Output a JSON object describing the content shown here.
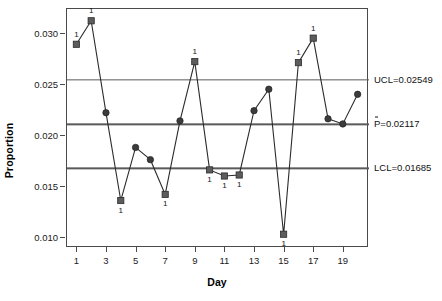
{
  "chart_data": {
    "type": "line",
    "title": "",
    "xlabel": "Day",
    "ylabel": "Proportion",
    "grid": false,
    "legend": "none",
    "xlim": [
      0.3,
      20.7
    ],
    "ylim": [
      0.00905,
      0.03245
    ],
    "x": [
      1,
      2,
      3,
      4,
      5,
      6,
      7,
      8,
      9,
      10,
      11,
      12,
      13,
      14,
      15,
      16,
      17,
      18,
      19,
      20
    ],
    "xticks": [
      1,
      3,
      5,
      7,
      9,
      11,
      13,
      15,
      17,
      19
    ],
    "xticklabels": [
      "1",
      "3",
      "5",
      "7",
      "9",
      "11",
      "13",
      "15",
      "17",
      "19"
    ],
    "yticks": [
      0.01,
      0.015,
      0.02,
      0.025,
      0.03
    ],
    "yticklabels": [
      "0.010",
      "0.015",
      "0.020",
      "0.025",
      "0.030"
    ],
    "series": [
      {
        "name": "Proportion",
        "values": [
          0.0289,
          0.0312,
          0.0222,
          0.0136,
          0.0188,
          0.0176,
          0.0142,
          0.0214,
          0.0272,
          0.0166,
          0.016,
          0.0161,
          0.0224,
          0.0245,
          0.0103,
          0.0271,
          0.0295,
          0.0216,
          0.0211,
          0.024
        ],
        "point_marker": [
          "square",
          "square",
          "circle",
          "square",
          "circle",
          "circle",
          "square",
          "circle",
          "square",
          "square",
          "square",
          "square",
          "circle",
          "circle",
          "square",
          "square",
          "square",
          "circle",
          "circle",
          "circle"
        ],
        "violation_flags": [
          "1",
          "1",
          "",
          "1",
          "",
          "",
          "1",
          "",
          "1",
          "1",
          "1",
          "1",
          "",
          "",
          "1",
          "1",
          "1",
          "",
          "",
          ""
        ],
        "violation_label_side": [
          "above",
          "above",
          "",
          "below",
          "",
          "",
          "below",
          "",
          "above",
          "below",
          "below",
          "below",
          "",
          "",
          "below",
          "above",
          "above",
          "",
          "",
          ""
        ],
        "line_color": "#2b2b2b",
        "marker_color": "#3c3c3c",
        "violation_marker_color": "#5c5c5c"
      }
    ],
    "control_limits": [
      {
        "name": "UCL",
        "label": "UCL=0.02549",
        "value": 0.02549,
        "color": "#5a5a5a"
      },
      {
        "name": "CL",
        "label": "P=0.02117",
        "value": 0.02117,
        "color": "#5a5a5a",
        "overbar": true
      },
      {
        "name": "LCL",
        "label": "LCL=0.01685",
        "value": 0.01685,
        "color": "#5a5a5a"
      }
    ]
  }
}
